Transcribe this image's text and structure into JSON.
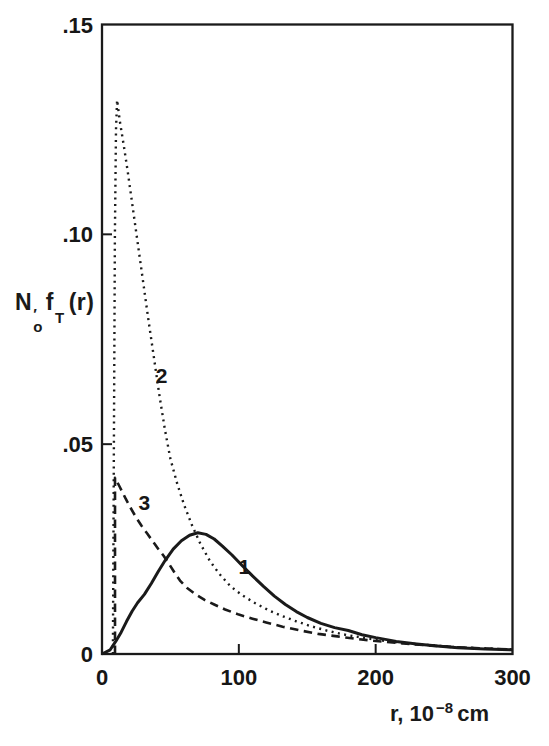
{
  "figure": {
    "background": "#ffffff",
    "ink_color": "#1a1a1a"
  },
  "chart_data": {
    "type": "line",
    "title": "",
    "ylabel": "N'o fT(r)",
    "ylabel_parts": {
      "base": "N",
      "prime": "′",
      "sub": "o",
      "func": "f",
      "func_sub": "T",
      "arg": "(r)"
    },
    "xlabel": "r, 10^-8 cm",
    "xlabel_parts": {
      "lead": "r, 10",
      "exp": "−8",
      "unit": "cm"
    },
    "grid": false,
    "legend": "none",
    "frame": "box",
    "x_axis": {
      "min": 0,
      "max": 300,
      "ticks": [
        {
          "value": 0,
          "label": "0",
          "tick": false
        },
        {
          "value": 100,
          "label": "100",
          "tick": true
        },
        {
          "value": 200,
          "label": "200",
          "tick": true
        },
        {
          "value": 300,
          "label": "300",
          "tick": false
        }
      ]
    },
    "y_axis": {
      "min": 0,
      "max": 0.15,
      "ticks": [
        {
          "value": 0,
          "label": "0",
          "tick": false
        },
        {
          "value": 0.05,
          "label": ".05",
          "tick": true
        },
        {
          "value": 0.1,
          "label": ".10",
          "tick": true
        },
        {
          "value": 0.15,
          "label": ".15",
          "tick": false
        }
      ]
    },
    "series": [
      {
        "name": "1",
        "line_style": "solid",
        "points": [
          [
            0,
            0
          ],
          [
            6,
            0.001
          ],
          [
            10,
            0.003
          ],
          [
            14,
            0.0052
          ],
          [
            18,
            0.0078
          ],
          [
            22,
            0.0102
          ],
          [
            26,
            0.0122
          ],
          [
            31,
            0.0142
          ],
          [
            36,
            0.0168
          ],
          [
            41,
            0.0196
          ],
          [
            46,
            0.0222
          ],
          [
            52,
            0.025
          ],
          [
            58,
            0.027
          ],
          [
            64,
            0.0283
          ],
          [
            70,
            0.0289
          ],
          [
            76,
            0.0285
          ],
          [
            82,
            0.0274
          ],
          [
            88,
            0.0257
          ],
          [
            95,
            0.0236
          ],
          [
            102,
            0.0212
          ],
          [
            110,
            0.0186
          ],
          [
            118,
            0.0161
          ],
          [
            126,
            0.0138
          ],
          [
            134,
            0.0118
          ],
          [
            142,
            0.0101
          ],
          [
            150,
            0.0087
          ],
          [
            160,
            0.0073
          ],
          [
            170,
            0.0063
          ],
          [
            180,
            0.0056
          ],
          [
            190,
            0.0046
          ],
          [
            200,
            0.0039
          ],
          [
            215,
            0.003
          ],
          [
            230,
            0.0024
          ],
          [
            245,
            0.0019
          ],
          [
            260,
            0.0015
          ],
          [
            280,
            0.0012
          ],
          [
            300,
            0.001
          ]
        ]
      },
      {
        "name": "2",
        "line_style": "dotted",
        "points": [
          [
            8,
            0
          ],
          [
            8.7,
            0.05
          ],
          [
            9.4,
            0.1
          ],
          [
            10.2,
            0.125
          ],
          [
            11,
            0.132
          ],
          [
            13,
            0.127
          ],
          [
            16,
            0.121
          ],
          [
            19,
            0.1145
          ],
          [
            22,
            0.1075
          ],
          [
            25,
            0.1005
          ],
          [
            28,
            0.0935
          ],
          [
            31,
            0.0865
          ],
          [
            34,
            0.0795
          ],
          [
            38,
            0.0705
          ],
          [
            42,
            0.0615
          ],
          [
            46,
            0.0535
          ],
          [
            50,
            0.0465
          ],
          [
            55,
            0.0405
          ],
          [
            60,
            0.0355
          ],
          [
            66,
            0.0305
          ],
          [
            72,
            0.0262
          ],
          [
            79,
            0.0221
          ],
          [
            86,
            0.019
          ],
          [
            94,
            0.0161
          ],
          [
            103,
            0.0139
          ],
          [
            112,
            0.0121
          ],
          [
            122,
            0.0104
          ],
          [
            132,
            0.009
          ],
          [
            142,
            0.0078
          ],
          [
            152,
            0.0067
          ],
          [
            164,
            0.0056
          ],
          [
            176,
            0.0047
          ],
          [
            190,
            0.0039
          ],
          [
            205,
            0.0032
          ],
          [
            220,
            0.0026
          ],
          [
            240,
            0.0021
          ],
          [
            260,
            0.0016
          ],
          [
            280,
            0.0013
          ],
          [
            300,
            0.0011
          ]
        ]
      },
      {
        "name": "3",
        "line_style": "dashed",
        "points": [
          [
            9.5,
            0
          ],
          [
            9.5,
            0.042
          ],
          [
            13,
            0.0398
          ],
          [
            17,
            0.0372
          ],
          [
            21,
            0.0348
          ],
          [
            25,
            0.0325
          ],
          [
            29,
            0.0305
          ],
          [
            33,
            0.0287
          ],
          [
            37,
            0.0269
          ],
          [
            41,
            0.0251
          ],
          [
            45,
            0.0234
          ],
          [
            49,
            0.0215
          ],
          [
            53,
            0.0194
          ],
          [
            57,
            0.0175
          ],
          [
            62,
            0.0158
          ],
          [
            68,
            0.0143
          ],
          [
            75,
            0.0129
          ],
          [
            82,
            0.0118
          ],
          [
            90,
            0.0106
          ],
          [
            100,
            0.0094
          ],
          [
            110,
            0.0084
          ],
          [
            120,
            0.0075
          ],
          [
            132,
            0.0065
          ],
          [
            145,
            0.0056
          ],
          [
            158,
            0.0048
          ],
          [
            172,
            0.0042
          ],
          [
            186,
            0.0036
          ],
          [
            200,
            0.0031
          ],
          [
            220,
            0.0025
          ],
          [
            240,
            0.002
          ],
          [
            260,
            0.0016
          ],
          [
            280,
            0.0013
          ],
          [
            300,
            0.0011
          ]
        ]
      }
    ],
    "annotations": [
      {
        "text": "1",
        "r": 104,
        "v": 0.019
      },
      {
        "text": "2",
        "r": 43.5,
        "v": 0.0645
      },
      {
        "text": "3",
        "r": 31,
        "v": 0.0343
      }
    ]
  }
}
